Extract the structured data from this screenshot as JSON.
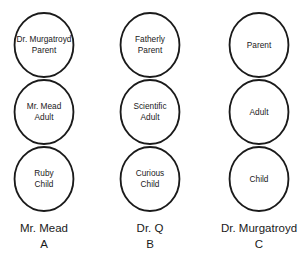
{
  "diagrams": [
    {
      "name": "Mr. Mead",
      "letter": "A",
      "circles": [
        {
          "line1": "Dr. Murgatroyd",
          "line2": "Parent"
        },
        {
          "line1": "Mr. Mead",
          "line2": "Adult"
        },
        {
          "line1": "Ruby",
          "line2": "Child"
        }
      ]
    },
    {
      "name": "Dr. Q",
      "letter": "B",
      "circles": [
        {
          "line1": "Fatherly",
          "line2": "Parent"
        },
        {
          "line1": "Scientific",
          "line2": "Adult"
        },
        {
          "line1": "Curious",
          "line2": "Child"
        }
      ]
    },
    {
      "name": "Dr. Murgatroyd",
      "letter": "C",
      "circles": [
        {
          "line1": "Parent",
          "line2": ""
        },
        {
          "line1": "Adult",
          "line2": ""
        },
        {
          "line1": "Child",
          "line2": ""
        }
      ]
    }
  ]
}
